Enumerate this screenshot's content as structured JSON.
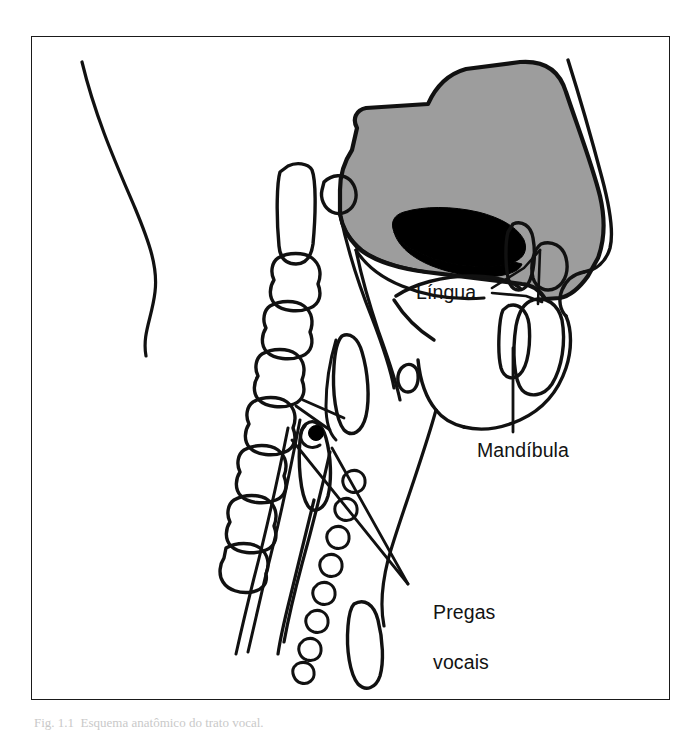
{
  "figure": {
    "type": "anatomical-diagram",
    "language": "pt-BR",
    "frame": {
      "x": 31,
      "y": 36,
      "width": 639,
      "height": 664,
      "border_color": "#1a1a1a"
    },
    "background_color": "#ffffff",
    "line_color": "#111111",
    "fill_colors": {
      "hard_soft_palate_skull": "#9d9d9d",
      "oral_nasal_airway_cavity": "#000000",
      "white_structures": "#ffffff"
    },
    "caption": "Fig. 1.1  Esquema anatômico do trato vocal."
  },
  "labels": {
    "lingua": {
      "text": "Língua",
      "x": 416,
      "y": 280
    },
    "mandibula": {
      "text": "Mandíbula",
      "x": 477,
      "y": 438
    },
    "pregas_vocais_line1": {
      "text": "Pregas",
      "x": 411,
      "y": 575
    },
    "pregas_vocais_line2": {
      "text": "vocais",
      "x": 411,
      "y": 600
    }
  },
  "structures": [
    {
      "name": "nape-neck-contour",
      "description": "Posterior neck and occiput outline at left"
    },
    {
      "name": "cranial-base-palate",
      "description": "Gray-filled hard and soft palate / cranial base mass"
    },
    {
      "name": "oral-nasal-cavity",
      "description": "Black-filled air cavity above the tongue"
    },
    {
      "name": "cervical-vertebrae",
      "description": "Stacked cervical vertebrae C1 through C6"
    },
    {
      "name": "odontoid-process",
      "description": "Upper elongated vertebral body"
    },
    {
      "name": "tongue-body",
      "description": "Tongue mass within the oral cavity"
    },
    {
      "name": "upper-teeth",
      "description": "Maxillary incisor"
    },
    {
      "name": "lower-teeth",
      "description": "Mandibular incisor"
    },
    {
      "name": "lips-profile",
      "description": "Upper and lower lip contour"
    },
    {
      "name": "nose-profile",
      "description": "Nasal dorsum and tip outline"
    },
    {
      "name": "mandible-body",
      "description": "Mandible bone outline"
    },
    {
      "name": "hyoid-bone",
      "description": "Small floating bone above larynx"
    },
    {
      "name": "epiglottis",
      "description": "Leaf-shaped cartilage above vocal folds"
    },
    {
      "name": "thyroid-cartilage",
      "description": "Laryngeal cartilage with vocal fold attachment"
    },
    {
      "name": "vocal-folds",
      "description": "Paired folds inside the larynx"
    },
    {
      "name": "tracheal-rings",
      "description": "Chain of cartilage rings forming the trachea"
    },
    {
      "name": "esophagus",
      "description": "Tube posterior to the trachea"
    },
    {
      "name": "sternum-manubrium",
      "description": "Lower bone outline at the chest"
    }
  ],
  "leader_lines": [
    {
      "for": "lingua",
      "count": 2,
      "description": "Two lines fanning right to the tongue"
    },
    {
      "for": "mandibula",
      "count": 1,
      "description": "Vertical line up to the mandible"
    },
    {
      "for": "pregas_vocais",
      "count": 2,
      "description": "Two crossing lines up-left to the larynx"
    }
  ]
}
